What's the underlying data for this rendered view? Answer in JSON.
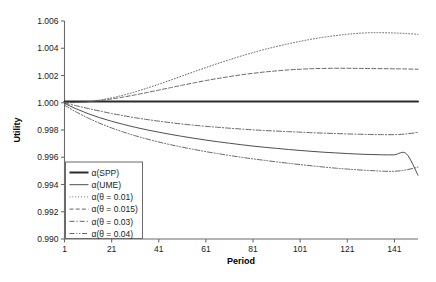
{
  "chart_data": {
    "type": "line",
    "title": "",
    "xlabel": "Period",
    "ylabel": "Utility",
    "xlim": [
      1,
      151
    ],
    "ylim": [
      0.99,
      1.006
    ],
    "grid": false,
    "legend_position": "lower-left-inside",
    "xticks": [
      "1",
      "21",
      "41",
      "61",
      "81",
      "101",
      "121",
      "141"
    ],
    "xtick_values": [
      1,
      21,
      41,
      61,
      81,
      101,
      121,
      141
    ],
    "yticks": [
      "1.006",
      "1.004",
      "1.002",
      "1.000",
      "0.998",
      "0.996",
      "0.994",
      "0.992",
      "0.990"
    ],
    "ytick_values": [
      1.006,
      1.004,
      1.002,
      1.0,
      0.998,
      0.996,
      0.994,
      0.992,
      0.99
    ],
    "x": [
      1,
      6,
      11,
      16,
      21,
      26,
      31,
      36,
      41,
      46,
      51,
      56,
      61,
      66,
      71,
      76,
      81,
      86,
      91,
      96,
      101,
      106,
      111,
      116,
      121,
      126,
      131,
      136,
      141,
      146,
      151
    ],
    "series": [
      {
        "name": "α(SPP)",
        "style": "solid-thick",
        "color": "#2b2b2b",
        "width": 2.0,
        "values": [
          1.0001,
          1.0001,
          1.0001,
          1.0001,
          1.0001,
          1.0001,
          1.0001,
          1.0001,
          1.0001,
          1.0001,
          1.0001,
          1.0001,
          1.0001,
          1.0001,
          1.0001,
          1.0001,
          1.0001,
          1.0001,
          1.0001,
          1.0001,
          1.0001,
          1.0001,
          1.0001,
          1.0001,
          1.0001,
          1.0001,
          1.0001,
          1.0001,
          1.0001,
          1.0001,
          1.0001
        ]
      },
      {
        "name": "α(UME)",
        "style": "solid-thin",
        "color": "#3a3a3a",
        "width": 0.9,
        "values": [
          0.99995,
          0.99955,
          0.9992,
          0.9989,
          0.99864,
          0.99841,
          0.9982,
          0.99801,
          0.99784,
          0.99768,
          0.99753,
          0.99739,
          0.99726,
          0.99714,
          0.99703,
          0.99692,
          0.99682,
          0.99673,
          0.99665,
          0.99657,
          0.9965,
          0.99643,
          0.99637,
          0.99632,
          0.99627,
          0.99623,
          0.9962,
          0.99618,
          0.99618,
          0.99627,
          0.99468
        ]
      },
      {
        "name": "α(θ = 0.01)",
        "style": "dotted",
        "color": "#555555",
        "width": 0.9,
        "values": [
          1.0,
          1.00002,
          1.00008,
          1.0002,
          1.00036,
          1.00056,
          1.0008,
          1.00107,
          1.00136,
          1.00166,
          1.00197,
          1.00228,
          1.00258,
          1.00288,
          1.00316,
          1.00343,
          1.00368,
          1.00392,
          1.00413,
          1.00433,
          1.00451,
          1.00467,
          1.00481,
          1.00493,
          1.00503,
          1.0051,
          1.00514,
          1.00514,
          1.00512,
          1.00508,
          1.00502
        ]
      },
      {
        "name": "α(θ = 0.015)",
        "style": "dashed",
        "color": "#555555",
        "width": 0.9,
        "values": [
          1.0,
          1.00002,
          1.00007,
          1.00016,
          1.00028,
          1.00042,
          1.00058,
          1.00075,
          1.00093,
          1.00111,
          1.00129,
          1.00146,
          1.00163,
          1.00178,
          1.00192,
          1.00205,
          1.00216,
          1.00226,
          1.00234,
          1.00241,
          1.00246,
          1.0025,
          1.00252,
          1.00253,
          1.00253,
          1.00252,
          1.00251,
          1.0025,
          1.00249,
          1.00248,
          1.00246
        ]
      },
      {
        "name": "α(θ = 0.03)",
        "style": "dash-dot",
        "color": "#555555",
        "width": 0.9,
        "values": [
          0.99997,
          0.99978,
          0.99958,
          0.99939,
          0.99921,
          0.99905,
          0.9989,
          0.99877,
          0.99865,
          0.99854,
          0.99844,
          0.99835,
          0.99827,
          0.9982,
          0.99813,
          0.99807,
          0.99801,
          0.99796,
          0.99792,
          0.99788,
          0.99784,
          0.9978,
          0.99777,
          0.99774,
          0.99771,
          0.99769,
          0.99767,
          0.99766,
          0.99766,
          0.99771,
          0.99783
        ]
      },
      {
        "name": "α(θ = 0.04)",
        "style": "dash-dot-dot",
        "color": "#555555",
        "width": 0.9,
        "values": [
          0.99982,
          0.99932,
          0.99888,
          0.99849,
          0.99815,
          0.99785,
          0.99758,
          0.99734,
          0.99712,
          0.99692,
          0.99674,
          0.99657,
          0.99641,
          0.99627,
          0.99613,
          0.996,
          0.99588,
          0.99577,
          0.99566,
          0.99556,
          0.99546,
          0.99537,
          0.99528,
          0.9952,
          0.99513,
          0.99507,
          0.99502,
          0.99498,
          0.99497,
          0.99507,
          0.99528
        ]
      }
    ]
  },
  "legend": {
    "items": [
      {
        "label": "α(SPP)"
      },
      {
        "label": "α(UME)"
      },
      {
        "label": "α(θ = 0.01)"
      },
      {
        "label": "α(θ = 0.015)"
      },
      {
        "label": "α(θ = 0.03)"
      },
      {
        "label": "α(θ = 0.04)"
      }
    ]
  },
  "axes": {
    "x_title": "Period",
    "y_title": "Utility",
    "axis_color": "#6b6b6b"
  }
}
